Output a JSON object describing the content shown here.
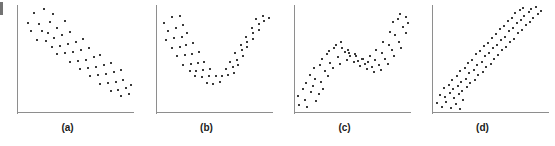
{
  "figure": {
    "background_color": "#ffffff",
    "axis_color": "#8e8e8e",
    "dot_color": "#3a3a3a",
    "label_color": "#1a1a1a",
    "panel_labels": [
      "(a)",
      "(b)",
      "(c)",
      "(d)"
    ]
  },
  "chart_data": [
    {
      "type": "scatter",
      "title": "",
      "label": "(a)",
      "pattern": "negative linear relationship",
      "xlabel": "",
      "ylabel": "",
      "xlim": [
        0,
        100
      ],
      "ylim": [
        0,
        100
      ],
      "grid": false,
      "legend": "none",
      "axes": "left and bottom spines only, no tick labels",
      "points": [
        [
          13,
          93
        ],
        [
          22,
          97
        ],
        [
          8,
          84
        ],
        [
          18,
          83
        ],
        [
          27,
          85
        ],
        [
          30,
          92
        ],
        [
          11,
          76
        ],
        [
          20,
          76
        ],
        [
          26,
          74
        ],
        [
          34,
          79
        ],
        [
          41,
          86
        ],
        [
          16,
          68
        ],
        [
          24,
          67
        ],
        [
          31,
          70
        ],
        [
          38,
          72
        ],
        [
          45,
          75
        ],
        [
          29,
          61
        ],
        [
          36,
          62
        ],
        [
          43,
          64
        ],
        [
          50,
          66
        ],
        [
          57,
          69
        ],
        [
          34,
          54
        ],
        [
          41,
          55
        ],
        [
          48,
          56
        ],
        [
          55,
          58
        ],
        [
          62,
          60
        ],
        [
          45,
          47
        ],
        [
          52,
          48
        ],
        [
          59,
          49
        ],
        [
          66,
          51
        ],
        [
          72,
          53
        ],
        [
          54,
          40
        ],
        [
          61,
          41
        ],
        [
          68,
          42
        ],
        [
          75,
          44
        ],
        [
          81,
          46
        ],
        [
          63,
          33
        ],
        [
          70,
          34
        ],
        [
          77,
          35
        ],
        [
          84,
          37
        ],
        [
          90,
          39
        ],
        [
          72,
          26
        ],
        [
          79,
          27
        ],
        [
          86,
          28
        ],
        [
          92,
          30
        ],
        [
          81,
          19
        ],
        [
          88,
          20
        ],
        [
          95,
          22
        ],
        [
          99,
          25
        ],
        [
          90,
          14
        ],
        [
          97,
          16
        ]
      ]
    },
    {
      "type": "scatter",
      "title": "",
      "label": "(b)",
      "pattern": "U-shaped curvilinear relationship",
      "xlabel": "",
      "ylabel": "",
      "xlim": [
        0,
        100
      ],
      "ylim": [
        0,
        100
      ],
      "grid": false,
      "legend": "none",
      "axes": "left and bottom spines only, no tick labels",
      "points": [
        [
          5,
          84
        ],
        [
          12,
          90
        ],
        [
          19,
          91
        ],
        [
          9,
          76
        ],
        [
          16,
          79
        ],
        [
          22,
          82
        ],
        [
          7,
          68
        ],
        [
          14,
          70
        ],
        [
          21,
          71
        ],
        [
          26,
          74
        ],
        [
          12,
          60
        ],
        [
          19,
          61
        ],
        [
          25,
          63
        ],
        [
          31,
          65
        ],
        [
          17,
          52
        ],
        [
          24,
          53
        ],
        [
          30,
          54
        ],
        [
          36,
          56
        ],
        [
          22,
          44
        ],
        [
          29,
          45
        ],
        [
          35,
          46
        ],
        [
          41,
          47
        ],
        [
          28,
          38
        ],
        [
          34,
          38
        ],
        [
          40,
          39
        ],
        [
          46,
          40
        ],
        [
          33,
          33
        ],
        [
          39,
          32
        ],
        [
          45,
          33
        ],
        [
          51,
          33
        ],
        [
          43,
          27
        ],
        [
          49,
          26
        ],
        [
          55,
          28
        ],
        [
          57,
          33
        ],
        [
          62,
          34
        ],
        [
          67,
          36
        ],
        [
          60,
          40
        ],
        [
          66,
          42
        ],
        [
          71,
          44
        ],
        [
          64,
          47
        ],
        [
          70,
          49
        ],
        [
          75,
          52
        ],
        [
          68,
          55
        ],
        [
          74,
          58
        ],
        [
          79,
          61
        ],
        [
          73,
          63
        ],
        [
          79,
          66
        ],
        [
          84,
          69
        ],
        [
          78,
          71
        ],
        [
          84,
          74
        ],
        [
          89,
          77
        ],
        [
          83,
          79
        ],
        [
          89,
          83
        ],
        [
          94,
          86
        ],
        [
          87,
          88
        ],
        [
          93,
          91
        ],
        [
          98,
          89
        ]
      ]
    },
    {
      "type": "scatter",
      "title": "",
      "label": "(c)",
      "pattern": "S-shaped / wave-like increasing relationship with mid-range plateau",
      "xlabel": "",
      "ylabel": "",
      "xlim": [
        0,
        100
      ],
      "ylim": [
        0,
        100
      ],
      "grid": false,
      "legend": "none",
      "axes": "left and bottom spines only, no tick labels",
      "points": [
        [
          2,
          14
        ],
        [
          3,
          6
        ],
        [
          8,
          11
        ],
        [
          10,
          4
        ],
        [
          6,
          21
        ],
        [
          13,
          18
        ],
        [
          9,
          27
        ],
        [
          15,
          24
        ],
        [
          18,
          10
        ],
        [
          20,
          16
        ],
        [
          12,
          34
        ],
        [
          17,
          31
        ],
        [
          22,
          28
        ],
        [
          24,
          21
        ],
        [
          16,
          41
        ],
        [
          21,
          44
        ],
        [
          26,
          38
        ],
        [
          28,
          33
        ],
        [
          23,
          50
        ],
        [
          27,
          54
        ],
        [
          30,
          46
        ],
        [
          33,
          41
        ],
        [
          29,
          57
        ],
        [
          34,
          60
        ],
        [
          37,
          51
        ],
        [
          39,
          45
        ],
        [
          35,
          63
        ],
        [
          40,
          66
        ],
        [
          43,
          56
        ],
        [
          45,
          49
        ],
        [
          41,
          60
        ],
        [
          46,
          58
        ],
        [
          48,
          52
        ],
        [
          51,
          47
        ],
        [
          47,
          55
        ],
        [
          52,
          54
        ],
        [
          55,
          48
        ],
        [
          57,
          43
        ],
        [
          53,
          52
        ],
        [
          58,
          50
        ],
        [
          61,
          45
        ],
        [
          63,
          40
        ],
        [
          59,
          50
        ],
        [
          64,
          47
        ],
        [
          67,
          42
        ],
        [
          69,
          37
        ],
        [
          65,
          52
        ],
        [
          70,
          49
        ],
        [
          73,
          44
        ],
        [
          75,
          39
        ],
        [
          71,
          58
        ],
        [
          76,
          55
        ],
        [
          79,
          50
        ],
        [
          81,
          45
        ],
        [
          77,
          66
        ],
        [
          82,
          63
        ],
        [
          85,
          58
        ],
        [
          87,
          52
        ],
        [
          83,
          75
        ],
        [
          88,
          72
        ],
        [
          91,
          66
        ],
        [
          93,
          60
        ],
        [
          86,
          85
        ],
        [
          90,
          88
        ],
        [
          95,
          80
        ],
        [
          97,
          74
        ],
        [
          92,
          92
        ],
        [
          97,
          90
        ],
        [
          99,
          84
        ]
      ]
    },
    {
      "type": "scatter",
      "title": "",
      "label": "(d)",
      "pattern": "exponential / convex increasing relationship",
      "xlabel": "",
      "ylabel": "",
      "xlim": [
        0,
        100
      ],
      "ylim": [
        0,
        100
      ],
      "grid": false,
      "legend": "none",
      "axes": "left and bottom spines only, no tick labels",
      "points": [
        [
          3,
          8
        ],
        [
          7,
          4
        ],
        [
          11,
          9
        ],
        [
          15,
          3
        ],
        [
          19,
          7
        ],
        [
          23,
          2
        ],
        [
          5,
          15
        ],
        [
          10,
          13
        ],
        [
          14,
          17
        ],
        [
          18,
          12
        ],
        [
          22,
          16
        ],
        [
          26,
          11
        ],
        [
          9,
          22
        ],
        [
          13,
          25
        ],
        [
          17,
          21
        ],
        [
          21,
          24
        ],
        [
          25,
          19
        ],
        [
          29,
          23
        ],
        [
          16,
          30
        ],
        [
          20,
          33
        ],
        [
          24,
          28
        ],
        [
          28,
          31
        ],
        [
          32,
          27
        ],
        [
          36,
          30
        ],
        [
          23,
          38
        ],
        [
          27,
          41
        ],
        [
          31,
          36
        ],
        [
          35,
          39
        ],
        [
          39,
          34
        ],
        [
          43,
          37
        ],
        [
          30,
          46
        ],
        [
          34,
          49
        ],
        [
          38,
          44
        ],
        [
          42,
          47
        ],
        [
          46,
          42
        ],
        [
          50,
          45
        ],
        [
          37,
          54
        ],
        [
          41,
          57
        ],
        [
          45,
          52
        ],
        [
          49,
          55
        ],
        [
          53,
          50
        ],
        [
          57,
          53
        ],
        [
          44,
          62
        ],
        [
          48,
          65
        ],
        [
          52,
          60
        ],
        [
          56,
          63
        ],
        [
          60,
          58
        ],
        [
          64,
          61
        ],
        [
          51,
          70
        ],
        [
          55,
          73
        ],
        [
          59,
          68
        ],
        [
          63,
          71
        ],
        [
          67,
          66
        ],
        [
          71,
          69
        ],
        [
          58,
          78
        ],
        [
          62,
          81
        ],
        [
          66,
          76
        ],
        [
          70,
          79
        ],
        [
          74,
          74
        ],
        [
          78,
          77
        ],
        [
          65,
          86
        ],
        [
          69,
          89
        ],
        [
          73,
          84
        ],
        [
          77,
          87
        ],
        [
          81,
          82
        ],
        [
          85,
          85
        ],
        [
          72,
          93
        ],
        [
          76,
          96
        ],
        [
          80,
          91
        ],
        [
          84,
          94
        ],
        [
          88,
          89
        ],
        [
          92,
          92
        ],
        [
          79,
          98
        ],
        [
          86,
          97
        ],
        [
          90,
          99
        ],
        [
          95,
          95
        ]
      ]
    }
  ]
}
